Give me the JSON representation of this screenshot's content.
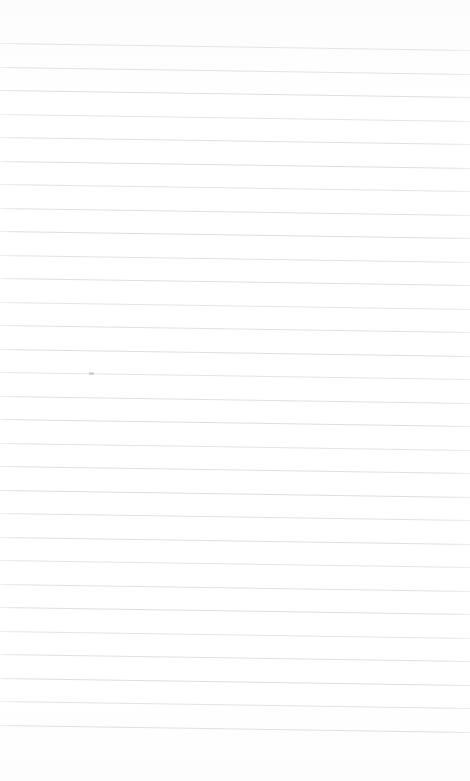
{
  "document": {
    "kind": "blank-ruled-paper-scan",
    "title": "",
    "body_text": "",
    "heading": "",
    "page_number": "",
    "date_text": "",
    "has_written_content": false
  },
  "colors": {
    "paper_background": "#fefefe",
    "rule_line": "#dedee1",
    "pencil_mark": "#b9b9bd"
  },
  "sheet": {
    "width": 470,
    "height": 781,
    "top_margin_px": 42,
    "bottom_margin_px": 55,
    "left_margin_px": 0,
    "right_margin_px": 0,
    "has_vertical_margin_rule": false
  },
  "ruling": {
    "line_count": 30,
    "first_line_y": 43,
    "line_spacing_px": 23.5,
    "line_thickness_px": 1,
    "skew_degrees": 0.84,
    "line_ys": [
      43,
      66.5,
      90,
      113.5,
      137,
      160.5,
      184,
      207.5,
      231,
      254.5,
      278,
      301.5,
      325,
      348.5,
      372,
      395.5,
      419,
      442.5,
      466,
      489.5,
      513,
      536.5,
      560,
      583.5,
      607,
      630.5,
      654,
      677.5,
      701,
      724.5
    ]
  },
  "marks": [
    {
      "name": "stray-pencil-mark",
      "x": 89,
      "y": 372,
      "width": 5,
      "height": 3
    }
  ]
}
